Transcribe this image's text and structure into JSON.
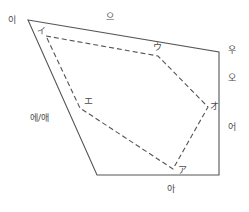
{
  "figure": {
    "background_color": "#ffffff",
    "solid_line_color": "#555555",
    "dashed_line_color": "#555555",
    "text_color": "#4a4a4a"
  },
  "korean_labels": {
    "i": "이",
    "eu": "으",
    "u": "우",
    "o": "오",
    "eo": "어",
    "a": "아",
    "e_ae": "에/애"
  },
  "japanese_labels": {
    "i": "イ",
    "u": "ウ",
    "e": "エ",
    "o": "オ",
    "a": "ア"
  },
  "chart_data": {
    "type": "scatter",
    "xlabel": "",
    "ylabel": "",
    "grid": false,
    "legend_position": "none",
    "series": [
      {
        "name": "Korean vowel space (solid quadrilateral)",
        "style": "solid",
        "closed": true,
        "points": [
          {
            "label": "이",
            "x": 28,
            "y": 20
          },
          {
            "label": "우",
            "x": 219,
            "y": 52
          },
          {
            "label": "아",
            "x": 219,
            "y": 175
          },
          {
            "label": "에/애",
            "x": 97,
            "y": 175
          }
        ]
      },
      {
        "name": "Japanese vowel space (dashed pentagon)",
        "style": "dashed",
        "closed": true,
        "points": [
          {
            "label": "イ",
            "x": 46,
            "y": 36
          },
          {
            "label": "ウ",
            "x": 158,
            "y": 56
          },
          {
            "label": "オ",
            "x": 208,
            "y": 107
          },
          {
            "label": "ア",
            "x": 173,
            "y": 169
          },
          {
            "label": "エ",
            "x": 80,
            "y": 108
          }
        ]
      }
    ],
    "annotations": [
      {
        "text": "이",
        "x": 12,
        "y": 22,
        "group": "korean"
      },
      {
        "text": "으",
        "x": 112,
        "y": 19,
        "group": "korean"
      },
      {
        "text": "우",
        "x": 232,
        "y": 52,
        "group": "korean"
      },
      {
        "text": "오",
        "x": 232,
        "y": 80,
        "group": "korean"
      },
      {
        "text": "어",
        "x": 232,
        "y": 129,
        "group": "korean"
      },
      {
        "text": "아",
        "x": 172,
        "y": 190,
        "group": "korean"
      },
      {
        "text": "에/애",
        "x": 46,
        "y": 119,
        "group": "korean"
      },
      {
        "text": "イ",
        "x": 41,
        "y": 32,
        "group": "japanese"
      },
      {
        "text": "ウ",
        "x": 158,
        "y": 49,
        "group": "japanese"
      },
      {
        "text": "エ",
        "x": 88,
        "y": 102,
        "group": "japanese"
      },
      {
        "text": "オ",
        "x": 214,
        "y": 108,
        "group": "japanese"
      },
      {
        "text": "ア",
        "x": 182,
        "y": 172,
        "group": "japanese"
      }
    ]
  }
}
